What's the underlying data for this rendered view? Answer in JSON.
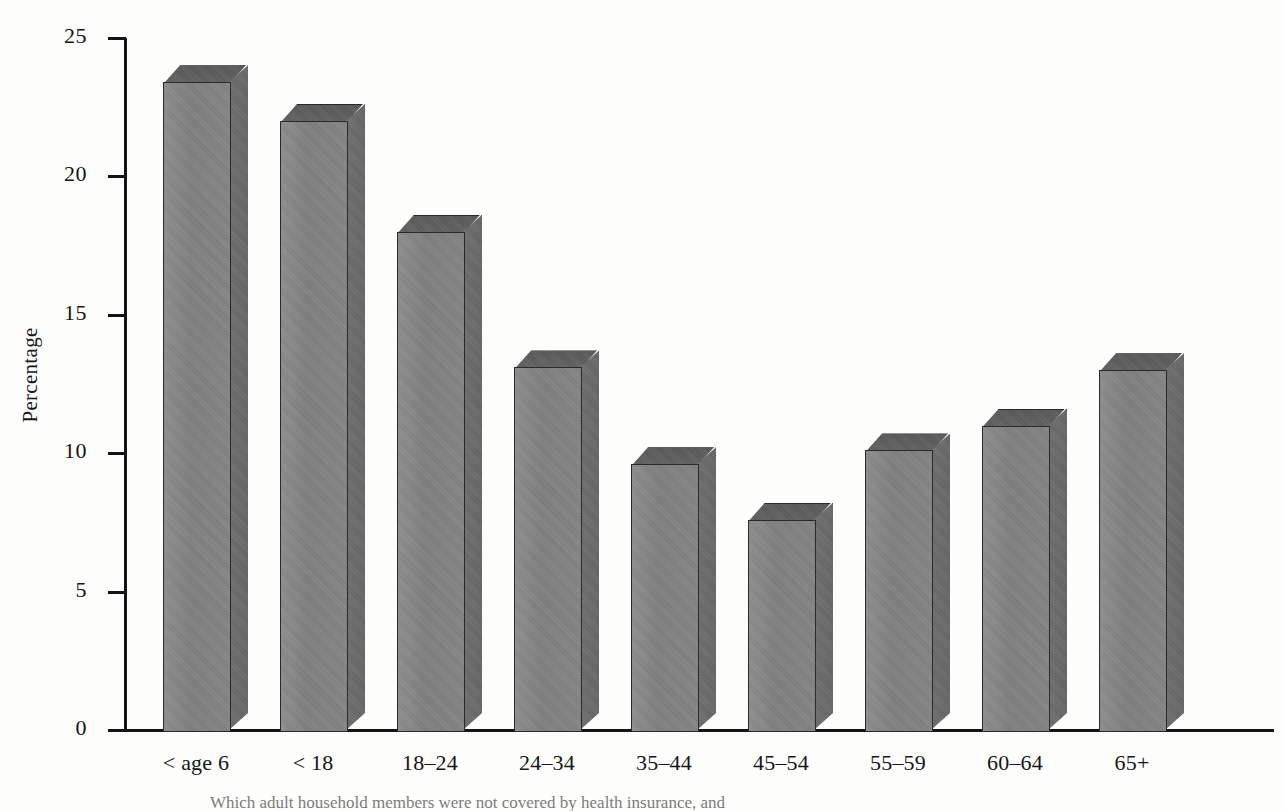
{
  "chart_data": {
    "type": "bar",
    "title": "",
    "xlabel": "",
    "ylabel": "Percentage",
    "ylim": [
      0,
      25
    ],
    "yticks": [
      0,
      5,
      10,
      15,
      20,
      25
    ],
    "ytick_labels": [
      "0",
      "5",
      "10",
      "15",
      "20",
      "25"
    ],
    "grid": false,
    "legend": "none",
    "style": "3d-bar",
    "bar_color": "#808080",
    "categories": [
      "< age 6",
      "< 18",
      "18–24",
      "24–34",
      "35–44",
      "45–54",
      "55–59",
      "60–64",
      "65+"
    ],
    "values": [
      23.4,
      22.0,
      18.0,
      13.1,
      9.6,
      7.6,
      10.1,
      11.0,
      13.0
    ],
    "series": [
      {
        "name": "Percentage",
        "values": [
          23.4,
          22.0,
          18.0,
          13.1,
          9.6,
          7.6,
          10.1,
          11.0,
          13.0
        ]
      }
    ]
  },
  "axis": {
    "y_label": "Percentage",
    "y_ticks": [
      "25",
      "20",
      "15",
      "10",
      "5",
      "0"
    ]
  },
  "caption": {
    "text": "Which adult household members were not covered by health insurance, and"
  }
}
